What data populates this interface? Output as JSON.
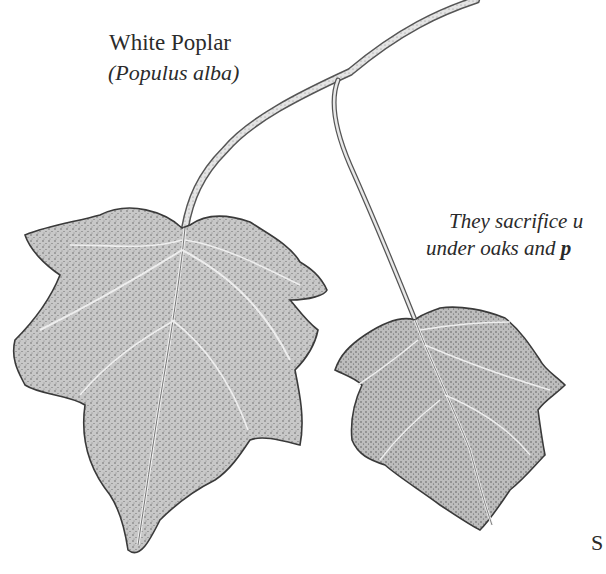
{
  "label": {
    "common_name": "White Poplar",
    "scientific_name": "(Populus alba)"
  },
  "body_text": {
    "line1": "They sacrifice u",
    "line2_prefix": "under oaks and ",
    "line2_bold": "p"
  },
  "corner_text": "S",
  "illustration": {
    "subject": "white-poplar-leaves-on-twig",
    "leaf_count": 2,
    "colors": {
      "ink": "#3a3a3a",
      "leaf_fill": "#c9c9c9",
      "leaf_shadow": "#a8a8a8",
      "twig": "#d8d8d8",
      "background": "#ffffff"
    }
  }
}
